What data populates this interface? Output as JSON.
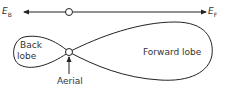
{
  "diagram": {
    "type": "antenna-radiation-pattern",
    "axis": {
      "left_label": "E",
      "left_subscript": "B",
      "right_label": "E",
      "right_subscript": "F"
    },
    "lobes": {
      "back": {
        "line1": "Back",
        "line2": "lobe"
      },
      "forward": {
        "label": "Forward lobe"
      }
    },
    "aerial": {
      "label": "Aerial"
    },
    "colors": {
      "stroke": "#222222",
      "text": "#333333",
      "background": "#ffffff"
    }
  }
}
